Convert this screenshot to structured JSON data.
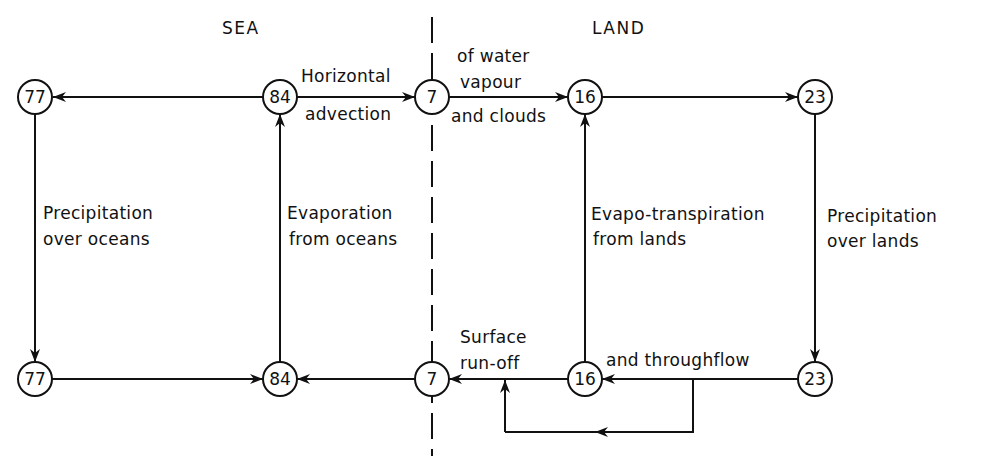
{
  "regions": {
    "sea": "SEA",
    "land": "LAND"
  },
  "nodes": {
    "sea_top_left": "77",
    "sea_top_right": "84",
    "boundary_top": "7",
    "land_top_left": "16",
    "land_top_right": "23",
    "sea_bottom_left": "77",
    "sea_bottom_right": "84",
    "boundary_bottom": "7",
    "land_bottom_left": "16",
    "land_bottom_right": "23"
  },
  "labels": {
    "horizontal": "Horizontal",
    "advection": "advection",
    "of_water": "of water",
    "vapour": "vapour",
    "and_clouds": "and clouds",
    "precip_oceans_1": "Precipitation",
    "precip_oceans_2": "over oceans",
    "evap_oceans_1": "Evaporation",
    "evap_oceans_2": "from oceans",
    "evapo_lands_1": "Evapo-transpiration",
    "evapo_lands_2": "from lands",
    "precip_lands_1": "Precipitation",
    "precip_lands_2": "over lands",
    "surface": "Surface",
    "runoff": "run-off",
    "throughflow": "and throughflow"
  },
  "colors": {
    "ink": "#111111",
    "background": "#ffffff"
  }
}
